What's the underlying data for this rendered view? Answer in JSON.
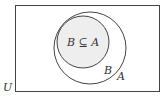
{
  "diagram": {
    "type": "venn",
    "universe": {
      "label": "U"
    },
    "sets": [
      {
        "id": "A",
        "label": "A"
      },
      {
        "id": "B",
        "label": "B"
      }
    ],
    "relation_label": "B ⊆ A",
    "colors": {
      "stroke": "#444444",
      "subset_fill": "#eeeeee",
      "background": "#ffffff",
      "text": "#333333"
    }
  }
}
